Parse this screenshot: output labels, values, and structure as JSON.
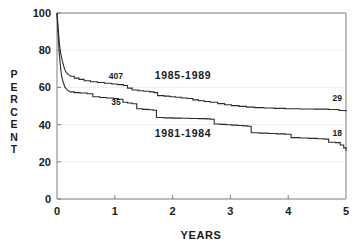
{
  "chart_data": {
    "type": "line",
    "title": "",
    "xlabel": "YEARS",
    "ylabel": "PERCENT",
    "xlim": [
      0,
      5
    ],
    "ylim": [
      0,
      100
    ],
    "xticks": [
      "0",
      "1",
      "2",
      "3",
      "4",
      "5"
    ],
    "yticks": [
      "0",
      "20",
      "40",
      "60",
      "80",
      "100"
    ],
    "grid": true,
    "grid_axis": "y",
    "legend_position": "inline-annotations",
    "annotations": [
      {
        "text": "407",
        "x": 1.02,
        "y": 64.5,
        "name": "upper-curve-count"
      },
      {
        "text": "1985-1989",
        "x": 2.18,
        "y": 64.5,
        "name": "upper-curve-name"
      },
      {
        "text": "35",
        "x": 1.02,
        "y": 50.5,
        "name": "lower-curve-count"
      },
      {
        "text": "1981-1984",
        "x": 2.18,
        "y": 33.5,
        "name": "lower-curve-name"
      },
      {
        "text": "29",
        "x": 4.85,
        "y": 52.5,
        "name": "upper-curve-end-count"
      },
      {
        "text": "18",
        "x": 4.85,
        "y": 34.0,
        "name": "lower-curve-end-count"
      }
    ],
    "series": [
      {
        "name": "1985-1989",
        "n_at_start": 407,
        "n_at_end": 29,
        "end_value": 47,
        "points": [
          [
            0.0,
            100.0
          ],
          [
            0.02,
            92.0
          ],
          [
            0.04,
            84.0
          ],
          [
            0.06,
            79.0
          ],
          [
            0.09,
            74.5
          ],
          [
            0.12,
            71.0
          ],
          [
            0.15,
            68.5
          ],
          [
            0.19,
            67.0
          ],
          [
            0.24,
            66.0
          ],
          [
            0.3,
            65.0
          ],
          [
            0.38,
            64.3
          ],
          [
            0.47,
            63.6
          ],
          [
            0.58,
            63.0
          ],
          [
            0.7,
            62.6
          ],
          [
            0.82,
            62.2
          ],
          [
            0.95,
            61.8
          ],
          [
            1.05,
            61.5
          ],
          [
            1.15,
            61.0
          ],
          [
            1.22,
            59.6
          ],
          [
            1.3,
            58.6
          ],
          [
            1.4,
            58.2
          ],
          [
            1.5,
            57.9
          ],
          [
            1.6,
            57.6
          ],
          [
            1.68,
            57.2
          ],
          [
            1.74,
            55.6
          ],
          [
            1.85,
            55.3
          ],
          [
            1.95,
            55.0
          ],
          [
            2.05,
            54.7
          ],
          [
            2.15,
            54.3
          ],
          [
            2.25,
            54.0
          ],
          [
            2.35,
            53.3
          ],
          [
            2.45,
            52.8
          ],
          [
            2.55,
            52.4
          ],
          [
            2.65,
            52.0
          ],
          [
            2.78,
            51.3
          ],
          [
            2.9,
            50.7
          ],
          [
            3.02,
            50.2
          ],
          [
            3.15,
            49.8
          ],
          [
            3.28,
            49.4
          ],
          [
            3.42,
            49.1
          ],
          [
            3.58,
            48.9
          ],
          [
            3.75,
            48.7
          ],
          [
            3.95,
            48.5
          ],
          [
            4.2,
            48.4
          ],
          [
            4.45,
            48.3
          ],
          [
            4.7,
            48.1
          ],
          [
            4.88,
            47.6
          ],
          [
            5.0,
            47.0
          ]
        ]
      },
      {
        "name": "1981-1984",
        "n_at_start": 35,
        "n_at_end": 18,
        "end_value": 26,
        "points": [
          [
            0.0,
            100.0
          ],
          [
            0.02,
            88.0
          ],
          [
            0.04,
            78.0
          ],
          [
            0.06,
            71.0
          ],
          [
            0.08,
            66.0
          ],
          [
            0.11,
            62.5
          ],
          [
            0.14,
            60.0
          ],
          [
            0.18,
            58.5
          ],
          [
            0.23,
            57.6
          ],
          [
            0.3,
            57.2
          ],
          [
            0.4,
            57.0
          ],
          [
            0.52,
            56.6
          ],
          [
            0.62,
            55.0
          ],
          [
            0.74,
            54.6
          ],
          [
            0.86,
            54.3
          ],
          [
            0.98,
            54.0
          ],
          [
            1.06,
            53.6
          ],
          [
            1.14,
            52.0
          ],
          [
            1.22,
            51.6
          ],
          [
            1.3,
            51.2
          ],
          [
            1.38,
            48.5
          ],
          [
            1.48,
            48.2
          ],
          [
            1.58,
            48.0
          ],
          [
            1.66,
            47.7
          ],
          [
            1.72,
            43.8
          ],
          [
            1.85,
            43.6
          ],
          [
            2.0,
            43.5
          ],
          [
            2.15,
            43.4
          ],
          [
            2.3,
            43.3
          ],
          [
            2.45,
            43.2
          ],
          [
            2.58,
            43.1
          ],
          [
            2.66,
            42.9
          ],
          [
            2.72,
            40.3
          ],
          [
            2.82,
            40.1
          ],
          [
            2.92,
            39.9
          ],
          [
            3.02,
            39.7
          ],
          [
            3.12,
            39.5
          ],
          [
            3.22,
            39.3
          ],
          [
            3.3,
            39.1
          ],
          [
            3.36,
            35.6
          ],
          [
            3.5,
            35.4
          ],
          [
            3.65,
            35.2
          ],
          [
            3.8,
            35.0
          ],
          [
            3.95,
            34.8
          ],
          [
            4.05,
            33.0
          ],
          [
            4.2,
            32.8
          ],
          [
            4.35,
            32.6
          ],
          [
            4.5,
            32.4
          ],
          [
            4.62,
            32.2
          ],
          [
            4.7,
            30.5
          ],
          [
            4.82,
            30.3
          ],
          [
            4.9,
            29.0
          ],
          [
            4.96,
            27.5
          ],
          [
            5.0,
            26.0
          ]
        ]
      }
    ]
  },
  "colors": {
    "curve": "#2b2b2b",
    "frame": "#7d7d7d",
    "grid": "#ededed",
    "text": "#1a1a1a",
    "background": "#ffffff"
  }
}
